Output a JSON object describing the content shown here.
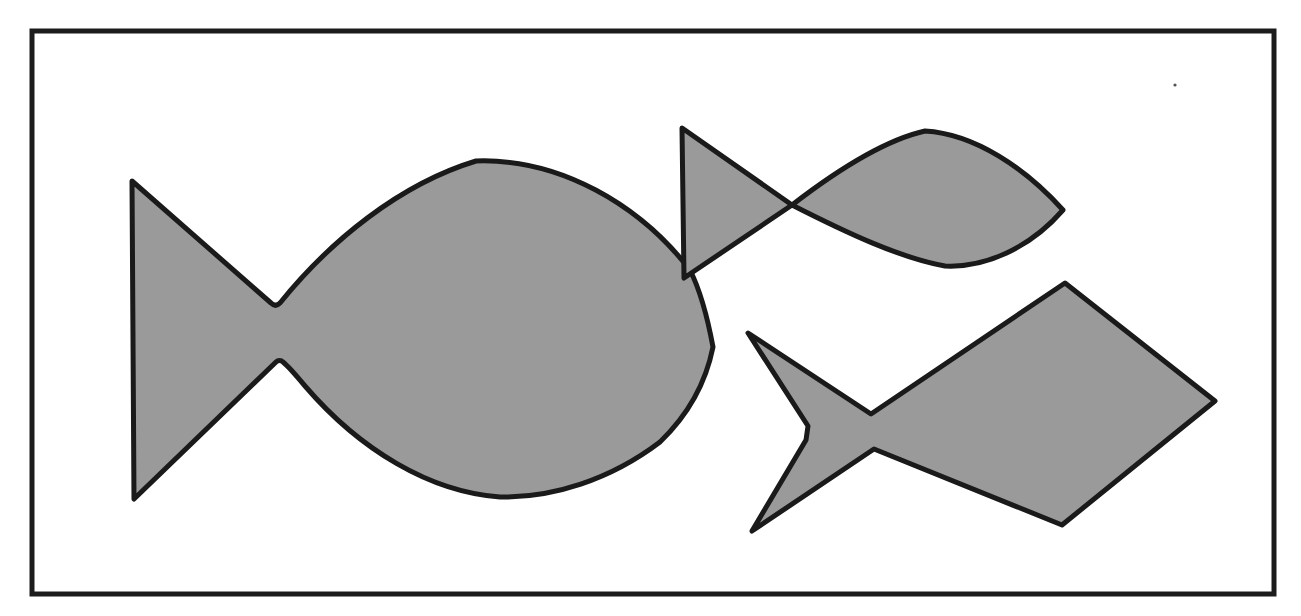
{
  "figure": {
    "description": "Line-art illustration of three stylized fish shapes filled with flat gray and outlined in black, arranged inside a rectangular frame.",
    "background_color": "#ffffff",
    "canvas": {
      "width": 1301,
      "height": 616
    }
  },
  "frame": {
    "name": "rectangular-border",
    "x": 32,
    "y": 31,
    "width": 1242,
    "height": 563,
    "stroke_color": "#1c1c1c",
    "stroke_width": 5,
    "fill": "none"
  },
  "style": {
    "fill_color": "#9a9a9a",
    "outline_color": "#1a1a1a",
    "outline_width": 5
  },
  "shapes": [
    {
      "id": "fish-large",
      "label": "Large fish with rounded lens body",
      "size_rank": "large",
      "facing": "right",
      "body_style": "curved-lens",
      "tail_style": "straight-forked",
      "fill_color": "#9a9a9a",
      "outline_color": "#1a1a1a",
      "bounds": {
        "x": 130,
        "y": 158,
        "width": 585,
        "height": 342
      },
      "key_points": {
        "tail_top_tip": [
          132,
          181
        ],
        "tail_bottom_tip": [
          134,
          499
        ],
        "waist_upper": [
          277,
          309
        ],
        "waist_lower": [
          280,
          357
        ],
        "body_top": [
          475,
          160
        ],
        "body_bottom": [
          500,
          497
        ],
        "nose_tip": [
          713,
          347
        ]
      },
      "path": "M 132 181 L 271 303 C 274 306 277 306 280 303 C 330 241 400 184 476 161 C 560 158 640 205 690 270 C 700 290 708 320 713 347 C 706 382 688 415 660 442 C 610 480 552 498 500 497 C 430 492 360 450 305 386 C 295 374 288 366 283 362 C 281 360 278 360 276 362 L 134 499 L 132 181 Z"
    },
    {
      "id": "fish-medium",
      "label": "Medium fish with leaf body and triangular tail",
      "size_rank": "medium",
      "facing": "right",
      "body_style": "curved-leaf",
      "tail_style": "triangular",
      "fill_color": "#9a9a9a",
      "outline_color": "#1a1a1a",
      "bounds": {
        "x": 681,
        "y": 126,
        "width": 383,
        "height": 152
      },
      "key_points": {
        "tail_top_tip": [
          682,
          128
        ],
        "tail_bottom_tip": [
          684,
          278
        ],
        "waist": [
          792,
          205
        ],
        "body_top": [
          922,
          131
        ],
        "body_bottom": [
          945,
          266
        ],
        "nose_tip": [
          1063,
          210
        ]
      },
      "path": "M 682 128 L 792 205 C 840 168 885 140 925 131 C 975 134 1025 168 1063 210 C 1030 248 985 268 945 266 C 900 258 845 232 792 205 L 684 278 L 682 128 Z"
    },
    {
      "id": "fish-small-angular",
      "label": "Angular fish with diamond body and swallow tail",
      "size_rank": "medium",
      "facing": "right",
      "body_style": "quadrilateral-diamond",
      "tail_style": "concave-swallowtail",
      "fill_color": "#9a9a9a",
      "outline_color": "#1a1a1a",
      "bounds": {
        "x": 746,
        "y": 281,
        "width": 470,
        "height": 252
      },
      "key_points": {
        "tail_top_tip": [
          748,
          333
        ],
        "tail_bottom_tip": [
          752,
          531
        ],
        "tail_notch_left_upper": [
          806,
          426
        ],
        "tail_notch_left_lower": [
          808,
          440
        ],
        "waist_upper": [
          871,
          414
        ],
        "waist_lower": [
          874,
          449
        ],
        "body_top": [
          1065,
          283
        ],
        "body_right": [
          1215,
          401
        ],
        "body_bottom": [
          1062,
          525
        ]
      },
      "path": "M 748 333 L 871 414 L 1065 283 L 1215 401 L 1062 525 L 874 449 L 752 531 L 806 440 L 808 426 L 748 333 Z"
    }
  ],
  "artifacts": [
    {
      "name": "scan-speck",
      "x": 1175,
      "y": 85,
      "radius": 1.6,
      "color": "#555555"
    }
  ]
}
